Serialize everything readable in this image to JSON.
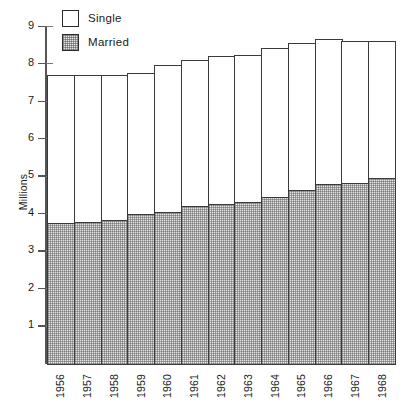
{
  "legend": {
    "items": [
      {
        "label": "Single",
        "swatch": "empty-square-icon",
        "color": "#ffffff"
      },
      {
        "label": "Married",
        "swatch": "hatched-square-icon",
        "color": "#e2e2e2"
      }
    ]
  },
  "axes": {
    "y_title": "Millions",
    "y_ticks": [
      "9",
      "8",
      "7",
      "6",
      "5",
      "4",
      "3",
      "2",
      "1"
    ],
    "y_min": 0,
    "y_max": 9
  },
  "chart_data": {
    "type": "bar",
    "stacked": true,
    "title": "",
    "xlabel": "",
    "ylabel": "Millions",
    "ylim": [
      0,
      9
    ],
    "grid": false,
    "legend_position": "top-left",
    "categories": [
      "1956",
      "1957",
      "1958",
      "1959",
      "1960",
      "1961",
      "1962",
      "1963",
      "1964",
      "1965",
      "1966",
      "1967",
      "1968"
    ],
    "series": [
      {
        "name": "Married",
        "values": [
          3.8,
          3.83,
          3.88,
          4.03,
          4.1,
          4.25,
          4.32,
          4.35,
          4.5,
          4.68,
          4.85,
          4.88,
          5.0
        ]
      },
      {
        "name": "Single",
        "values": [
          4.0,
          3.97,
          3.92,
          3.82,
          3.95,
          3.95,
          3.98,
          3.98,
          4.0,
          3.95,
          3.9,
          3.82,
          3.7
        ]
      }
    ],
    "totals": [
      7.8,
      7.8,
      7.8,
      7.85,
      8.05,
      8.2,
      8.3,
      8.33,
      8.5,
      8.63,
      8.75,
      8.7,
      8.7
    ]
  }
}
